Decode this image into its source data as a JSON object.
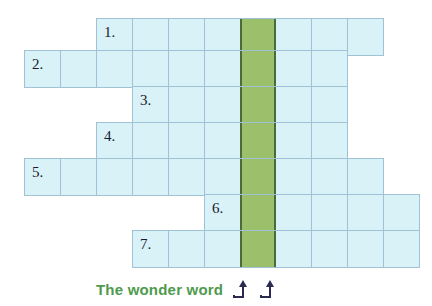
{
  "puzzle": {
    "type": "crossword",
    "cell_size": 36,
    "grid_origin": {
      "x": 24,
      "y": 18
    },
    "colors": {
      "cell_fill": "#d9f2f7",
      "cell_border": "#9fc3d4",
      "highlight_fill": "#9cbf6b",
      "highlight_border": "#4a6b3a",
      "caption_text": "#4e9a4e",
      "arrow": "#2b2b52",
      "number_text": "#1a1a2e"
    },
    "highlight_column_index": 6,
    "rows": [
      {
        "number": "1.",
        "start_col": 3,
        "length": 8,
        "top": 18,
        "left": 96,
        "highlight_offset": 4
      },
      {
        "number": "2.",
        "start_col": 0,
        "length": 9,
        "top": 50,
        "left": 24,
        "highlight_offset": 6
      },
      {
        "number": "3.",
        "start_col": 3,
        "length": 6,
        "top": 86,
        "left": 132,
        "highlight_offset": 3
      },
      {
        "number": "4.",
        "start_col": 2,
        "length": 7,
        "top": 122,
        "left": 96,
        "highlight_offset": 4
      },
      {
        "number": "5.",
        "start_col": 0,
        "length": 10,
        "top": 158,
        "left": 24,
        "highlight_offset": 6
      },
      {
        "number": "6.",
        "start_col": 5,
        "length": 6,
        "top": 194,
        "left": 204,
        "highlight_offset": 1
      },
      {
        "number": "7.",
        "start_col": 3,
        "length": 8,
        "top": 230,
        "left": 132,
        "highlight_offset": 3
      }
    ]
  },
  "caption": {
    "label": "The wonder word",
    "arrow_count": 2,
    "arrow_icon": "corner-up-arrow-icon"
  }
}
